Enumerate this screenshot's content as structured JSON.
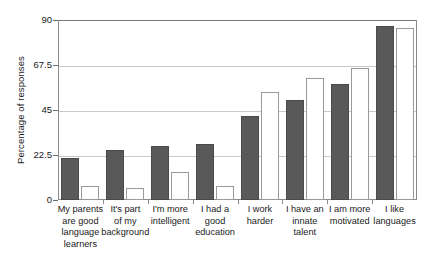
{
  "chart_data": {
    "type": "bar",
    "title": "",
    "xlabel": "",
    "ylabel": "Percentage of responses",
    "ylim": [
      0,
      90
    ],
    "yticks": [
      0,
      22.5,
      45,
      67.5,
      90
    ],
    "ytick_labels": [
      "0",
      "22.5",
      "45",
      "67.5",
      "90"
    ],
    "grid": true,
    "legend": "none",
    "categories": [
      "My parents\nare good\nlanguage\nlearners",
      "It's part\nof my\nbackground",
      "I'm more\nintelligent",
      "I had a\ngood\neducation",
      "I work\nharder",
      "I have an\ninnate\ntalent",
      "I am more\nmotivated",
      "I like\nlanguages"
    ],
    "series": [
      {
        "name": "series-dark",
        "color": "#595959",
        "values": [
          21,
          25,
          27,
          28,
          42,
          50,
          58,
          87
        ]
      },
      {
        "name": "series-light",
        "color": "#ffffff",
        "values": [
          7,
          6,
          14,
          7,
          54,
          61,
          66,
          86
        ]
      }
    ]
  },
  "axis": {
    "y_title": "Percentage of responses"
  }
}
